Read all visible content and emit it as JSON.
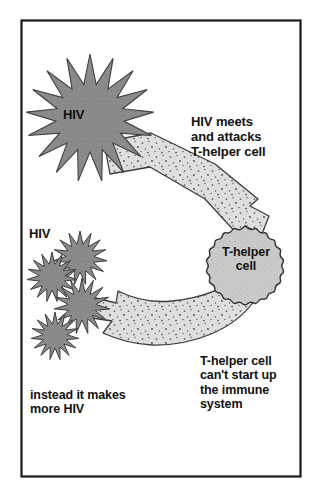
{
  "figure": {
    "frame": {
      "border_color": "#1a1a1a",
      "background": "#ffffff"
    },
    "palette": {
      "virus_fill": "#8a8a8a",
      "virus_stroke": "#3a3a3a",
      "cell_fill": "#c9c9c9",
      "cell_stroke": "#333333",
      "arrow_fill": "#dcdcdc",
      "arrow_stroke": "#404040",
      "arrow_speckle": "#4a4a4a",
      "text_color": "#111111"
    }
  },
  "labels": {
    "hiv_big": "HIV",
    "hiv_small": "HIV",
    "t_helper_cell": "T-helper\ncell",
    "attack_caption": "HIV meets\nand attacks\nT-helper cell",
    "immune_caption": "T-helper cell\ncan't start up\nthe immune\nsystem",
    "instead_caption": "instead it makes\nmore HIV"
  },
  "shapes": {
    "virus_large": {
      "name": "HIV virus particle",
      "cx": 90,
      "cy": 118,
      "radius_outer": 64,
      "radius_inner": 34,
      "points": 17
    },
    "virus_small": [
      {
        "name": "HIV virus particle",
        "cx": 80,
        "cy": 258,
        "radius_outer": 27,
        "radius_inner": 14,
        "points": 15
      },
      {
        "name": "HIV virus particle",
        "cx": 52,
        "cy": 277,
        "radius_outer": 25,
        "radius_inner": 13,
        "points": 15
      },
      {
        "name": "HIV virus particle",
        "cx": 82,
        "cy": 306,
        "radius_outer": 28,
        "radius_inner": 14,
        "points": 15
      },
      {
        "name": "HIV virus particle",
        "cx": 55,
        "cy": 336,
        "radius_outer": 24,
        "radius_inner": 12,
        "points": 15
      }
    ],
    "t_helper_cell": {
      "name": "T-helper cell",
      "cx": 245,
      "cy": 266,
      "radius": 40,
      "lobes": 22
    },
    "arrow_attack": {
      "name": "arrow from HIV to T-helper cell",
      "direction": "down-right"
    },
    "arrow_replicate": {
      "name": "arrow from T-helper cell to new HIV",
      "direction": "left"
    }
  }
}
